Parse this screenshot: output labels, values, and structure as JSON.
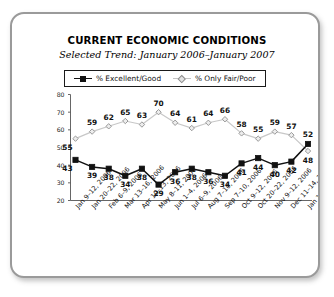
{
  "chart_data": {
    "type": "line",
    "title": "CURRENT ECONOMIC CONDITIONS",
    "subtitle": "Selected Trend: January 2006–January 2007",
    "xlabel": "",
    "ylabel": "",
    "ylim": [
      20,
      80
    ],
    "yticks": [
      20,
      30,
      40,
      50,
      60,
      70,
      80
    ],
    "grid": false,
    "legend_position": "top-center",
    "categories": [
      "Jan 9–12, 2006",
      "Jan 20–22, 2006",
      "Feb 6–9, 2006",
      "Mar 13–16, 2006",
      "Apr 10–13, 2006",
      "May 8–11, 2006",
      "Jun 1–4, 2006",
      "Jul 6–9, 2006",
      "Aug 7–10, 2006",
      "Sep 7–10, 2006",
      "Oct 9–12, 2006",
      "Oct 20–22, 2006",
      "Nov 9–12, 2006",
      "Dec 11–14, 2006",
      "Jan 15–18, 2007"
    ],
    "series": [
      {
        "name": "% Excellent/Good",
        "marker": "filled-square",
        "color": "#111111",
        "values": [
          43,
          39,
          38,
          34,
          38,
          29,
          36,
          38,
          36,
          34,
          41,
          44,
          40,
          42,
          52
        ]
      },
      {
        "name": "% Only Fair/Poor",
        "marker": "open-diamond",
        "color": "#b9b9b9",
        "values": [
          55,
          59,
          62,
          65,
          63,
          70,
          64,
          61,
          64,
          66,
          58,
          55,
          59,
          57,
          48
        ]
      }
    ]
  },
  "legend": {
    "entries": [
      {
        "label": "% Excellent/Good"
      },
      {
        "label": "% Only Fair/Poor"
      }
    ]
  }
}
